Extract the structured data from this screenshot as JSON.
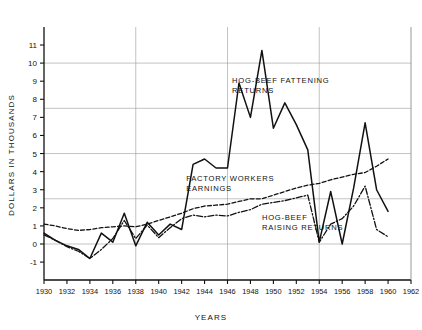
{
  "chart_data": {
    "type": "line",
    "title": "",
    "xlabel": "YEARS",
    "ylabel": "DOLLARS IN THOUSANDS",
    "xlim": [
      1930,
      1962
    ],
    "ylim": [
      -1.5,
      11.8
    ],
    "xticks": [
      1930,
      1932,
      1934,
      1936,
      1938,
      1940,
      1942,
      1944,
      1946,
      1948,
      1950,
      1952,
      1954,
      1956,
      1958,
      1960,
      1962
    ],
    "xtick_labels": [
      "1930",
      "1932",
      "1934",
      "1936",
      "1938",
      "1940",
      "1942",
      "1944",
      "1946",
      "1948",
      "1950",
      "1952",
      "1954",
      "1956",
      "1958",
      "1960",
      "1962"
    ],
    "yticks": [
      -1,
      0,
      1,
      2,
      3,
      4,
      5,
      6,
      7,
      8,
      9,
      10,
      11
    ],
    "ytick_labels": [
      "-1",
      "0",
      "1",
      "2",
      "3",
      "4",
      "5",
      "6",
      "7",
      "8",
      "9",
      "10",
      "11"
    ],
    "gridlines_y": [
      0,
      2.5,
      5,
      7.5,
      10
    ],
    "gridlines_x": [
      1938,
      1946,
      1954,
      1962
    ],
    "grid": true,
    "legend": "inline-annotations",
    "x": [
      1930,
      1931,
      1932,
      1933,
      1934,
      1935,
      1936,
      1937,
      1938,
      1939,
      1940,
      1941,
      1942,
      1943,
      1944,
      1945,
      1946,
      1947,
      1948,
      1949,
      1950,
      1951,
      1952,
      1953,
      1954,
      1955,
      1956,
      1957,
      1958,
      1959,
      1960
    ],
    "series": [
      {
        "name": "HOG-BEEF FATTENING RETURNS",
        "style": "solid",
        "label_line1": "HOG-BEEF FATTENING",
        "label_line2": "RETURNS",
        "color": "#111111",
        "values": [
          0.6,
          0.2,
          -0.1,
          -0.3,
          -0.8,
          0.6,
          0.1,
          1.7,
          -0.1,
          1.2,
          0.5,
          1.1,
          0.8,
          4.4,
          4.7,
          4.2,
          4.2,
          8.9,
          7.0,
          10.7,
          6.4,
          7.8,
          6.6,
          5.2,
          0.1,
          2.9,
          0.0,
          3.1,
          6.7,
          3.0,
          1.8
        ]
      },
      {
        "name": "FACTORY WORKERS EARNINGS",
        "style": "dashed",
        "label_line1": "FACTORY WORKERS",
        "label_line2": "EARNINGS",
        "color": "#111111",
        "values": [
          1.1,
          1.0,
          0.85,
          0.75,
          0.8,
          0.9,
          0.95,
          1.0,
          0.95,
          1.1,
          1.3,
          1.5,
          1.7,
          1.95,
          2.1,
          2.15,
          2.2,
          2.35,
          2.5,
          2.5,
          2.7,
          2.9,
          3.1,
          3.25,
          3.35,
          3.55,
          3.7,
          3.85,
          3.95,
          4.3,
          4.7
        ]
      },
      {
        "name": "HOG-BEEF RAISING RETURNS",
        "style": "dash-dot",
        "label_line1": "HOG-BEEF",
        "label_line2": "RAISING RETURNS",
        "color": "#111111",
        "values": [
          0.5,
          0.2,
          -0.15,
          -0.4,
          -0.8,
          -0.3,
          0.3,
          1.3,
          0.3,
          1.05,
          0.35,
          0.9,
          1.4,
          1.6,
          1.5,
          1.6,
          1.55,
          1.75,
          1.9,
          2.2,
          2.3,
          2.4,
          2.55,
          2.7,
          0.1,
          1.1,
          1.4,
          2.1,
          3.2,
          0.8,
          0.4
        ]
      }
    ],
    "annotations": [
      {
        "text_line1": "HOG-BEEF FATTENING",
        "text_line2": "RETURNS",
        "x": 1946.4,
        "y": 8.9
      },
      {
        "text_line1": "FACTORY WORKERS",
        "text_line2": "EARNINGS",
        "x": 1942.4,
        "y": 3.5
      },
      {
        "text_line1": "HOG-BEEF",
        "text_line2": "RAISING RETURNS",
        "x": 1949.0,
        "y": 1.3
      }
    ]
  },
  "axes": {
    "x_title": "YEARS",
    "y_title": "DOLLARS IN THOUSANDS"
  }
}
